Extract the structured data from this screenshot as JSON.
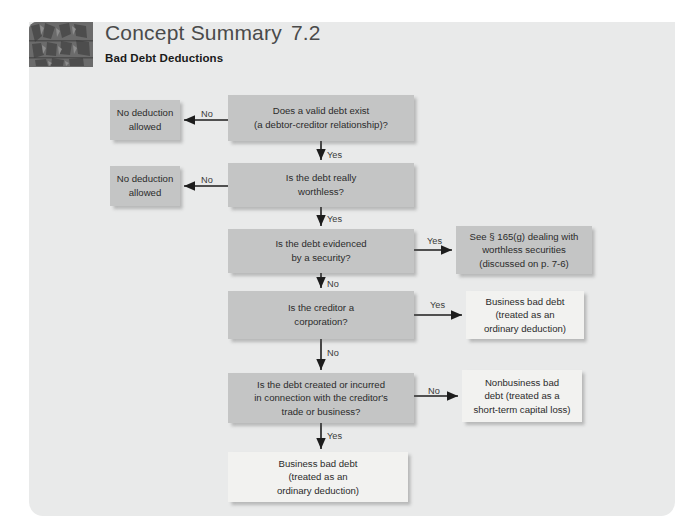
{
  "header": {
    "title": "Concept Summary",
    "number": "7.2",
    "subtitle": "Bad Debt Deductions",
    "thumbnail_name": "tree-bark-texture-thumbnail"
  },
  "colors": {
    "card_background": "#e9eaea",
    "page_background": "#ffffff",
    "decision_box": "#c4c5c5",
    "outcome_box_light": "#f2f2f0",
    "text": "#2b2b2b",
    "title_text": "#4a4a4a"
  },
  "chart_data": {
    "type": "flowchart",
    "title": "Bad Debt Deductions",
    "nodes": [
      {
        "id": "q1",
        "kind": "decision",
        "style": "gray",
        "text": "Does a valid debt exist\n(a debtor-creditor relationship)?",
        "x": 228,
        "y": 95,
        "w": 186,
        "h": 46
      },
      {
        "id": "no1",
        "kind": "terminal",
        "style": "gray",
        "text": "No deduction\nallowed",
        "x": 110,
        "y": 100,
        "w": 70,
        "h": 40
      },
      {
        "id": "q2",
        "kind": "decision",
        "style": "gray",
        "text": "Is the debt really\nworthless?",
        "x": 228,
        "y": 163,
        "w": 186,
        "h": 44
      },
      {
        "id": "no2",
        "kind": "terminal",
        "style": "gray",
        "text": "No deduction\nallowed",
        "x": 110,
        "y": 166,
        "w": 70,
        "h": 40
      },
      {
        "id": "q3",
        "kind": "decision",
        "style": "gray",
        "text": "Is the debt evidenced\nby a security?",
        "x": 228,
        "y": 229,
        "w": 186,
        "h": 44
      },
      {
        "id": "sec",
        "kind": "terminal",
        "style": "gray",
        "text": "See § 165(g) dealing with\nworthless securities\n(discussed on p. 7-6)",
        "x": 456,
        "y": 226,
        "w": 136,
        "h": 48
      },
      {
        "id": "q4",
        "kind": "decision",
        "style": "gray",
        "text": "Is the creditor a\ncorporation?",
        "x": 228,
        "y": 291,
        "w": 186,
        "h": 48
      },
      {
        "id": "bus1",
        "kind": "terminal",
        "style": "light",
        "text": "Business bad debt\n(treated as an\nordinary deduction)",
        "x": 466,
        "y": 291,
        "w": 118,
        "h": 48
      },
      {
        "id": "q5",
        "kind": "decision",
        "style": "gray",
        "text": "Is the debt created or incurred\nin connection with the creditor's\ntrade or business?",
        "x": 228,
        "y": 373,
        "w": 186,
        "h": 50
      },
      {
        "id": "nonbus",
        "kind": "terminal",
        "style": "light",
        "text": "Nonbusiness bad\ndebt (treated as a\nshort-term capital loss)",
        "x": 462,
        "y": 370,
        "w": 120,
        "h": 52
      },
      {
        "id": "bus2",
        "kind": "terminal",
        "style": "light",
        "text": "Business bad debt\n(treated as an\nordinary deduction)",
        "x": 228,
        "y": 452,
        "w": 180,
        "h": 50
      }
    ],
    "edges": [
      {
        "from": "q1",
        "to": "no1",
        "label": "No",
        "direction": "left"
      },
      {
        "from": "q1",
        "to": "q2",
        "label": "Yes",
        "direction": "down"
      },
      {
        "from": "q2",
        "to": "no2",
        "label": "No",
        "direction": "left"
      },
      {
        "from": "q2",
        "to": "q3",
        "label": "Yes",
        "direction": "down"
      },
      {
        "from": "q3",
        "to": "sec",
        "label": "Yes",
        "direction": "right"
      },
      {
        "from": "q3",
        "to": "q4",
        "label": "No",
        "direction": "down"
      },
      {
        "from": "q4",
        "to": "bus1",
        "label": "Yes",
        "direction": "right"
      },
      {
        "from": "q4",
        "to": "q5",
        "label": "No",
        "direction": "down"
      },
      {
        "from": "q5",
        "to": "nonbus",
        "label": "No",
        "direction": "right"
      },
      {
        "from": "q5",
        "to": "bus2",
        "label": "Yes",
        "direction": "down"
      }
    ],
    "edge_labels": [
      {
        "text": "No",
        "x": 201,
        "y": 109
      },
      {
        "text": "Yes",
        "x": 327,
        "y": 150
      },
      {
        "text": "No",
        "x": 201,
        "y": 175
      },
      {
        "text": "Yes",
        "x": 327,
        "y": 214
      },
      {
        "text": "Yes",
        "x": 427,
        "y": 236
      },
      {
        "text": "No",
        "x": 327,
        "y": 279
      },
      {
        "text": "Yes",
        "x": 430,
        "y": 300
      },
      {
        "text": "No",
        "x": 327,
        "y": 348
      },
      {
        "text": "No",
        "x": 428,
        "y": 386
      },
      {
        "text": "Yes",
        "x": 327,
        "y": 431
      }
    ]
  }
}
